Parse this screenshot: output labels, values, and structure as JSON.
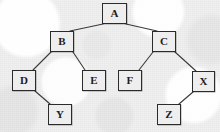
{
  "figure": {
    "type": "binary-tree-diagram",
    "background_color": "#f1f1f1",
    "node_fill_color": "#efeeee",
    "node_border_color": "#2b2b2b",
    "edge_color": "#3a3a3a"
  },
  "nodes": [
    {
      "id": "A",
      "label": "A",
      "x": 102,
      "y": 3,
      "w": 25,
      "h": 21
    },
    {
      "id": "B",
      "label": "B",
      "x": 50,
      "y": 31,
      "w": 24,
      "h": 21
    },
    {
      "id": "C",
      "label": "C",
      "x": 152,
      "y": 31,
      "w": 24,
      "h": 21
    },
    {
      "id": "D",
      "label": "D",
      "x": 12,
      "y": 70,
      "w": 24,
      "h": 21
    },
    {
      "id": "E",
      "label": "E",
      "x": 82,
      "y": 70,
      "w": 24,
      "h": 21
    },
    {
      "id": "F",
      "label": "F",
      "x": 118,
      "y": 70,
      "w": 24,
      "h": 21
    },
    {
      "id": "X",
      "label": "X",
      "x": 192,
      "y": 71,
      "w": 23,
      "h": 21
    },
    {
      "id": "Y",
      "label": "Y",
      "x": 48,
      "y": 104,
      "w": 24,
      "h": 21
    },
    {
      "id": "Z",
      "label": "Z",
      "x": 157,
      "y": 104,
      "w": 24,
      "h": 21
    }
  ],
  "edges": [
    {
      "from": "A",
      "to": "B",
      "x1": 103,
      "y1": 24,
      "x2": 70,
      "y2": 31
    },
    {
      "from": "A",
      "to": "C",
      "x1": 126,
      "y1": 24,
      "x2": 157,
      "y2": 31
    },
    {
      "from": "B",
      "to": "D",
      "x1": 51,
      "y1": 52,
      "x2": 33,
      "y2": 70
    },
    {
      "from": "B",
      "to": "E",
      "x1": 73,
      "y1": 52,
      "x2": 85,
      "y2": 70
    },
    {
      "from": "C",
      "to": "F",
      "x1": 153,
      "y1": 52,
      "x2": 139,
      "y2": 70
    },
    {
      "from": "C",
      "to": "X",
      "x1": 175,
      "y1": 52,
      "x2": 196,
      "y2": 71
    },
    {
      "from": "D",
      "to": "Y",
      "x1": 35,
      "y1": 91,
      "x2": 50,
      "y2": 104
    },
    {
      "from": "X",
      "to": "Z",
      "x1": 193,
      "y1": 92,
      "x2": 179,
      "y2": 104
    }
  ]
}
